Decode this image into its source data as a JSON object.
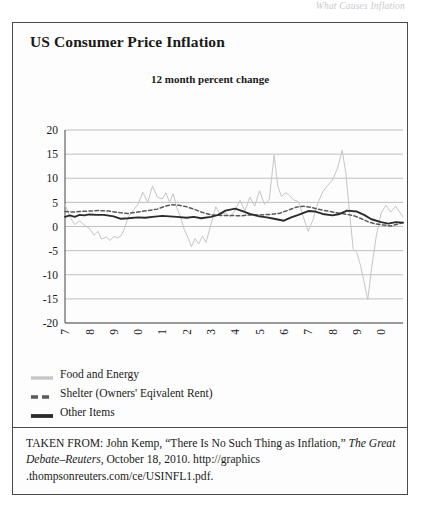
{
  "page": {
    "running_header": "What Causes Inflation"
  },
  "figure": {
    "title": "US Consumer Price Inflation",
    "subtitle": "12 month percent change"
  },
  "legend": {
    "items": [
      {
        "label": "Food and Energy",
        "color": "#c6c6c6",
        "style": "solid"
      },
      {
        "label": "Shelter (Owners' Eqivalent Rent)",
        "color": "#5a5a5a",
        "style": "dashed"
      },
      {
        "label": "Other Items",
        "color": "#2b2b2b",
        "style": "solid"
      }
    ]
  },
  "caption": {
    "lead": "TAKEN FROM: John Kemp, “There Is No Such Thing as Inflation,” ",
    "source_title": "The Great Debate–Reuters",
    "rest": ", October 18, 2010. http://graphics .thompsonreuters.com/ce/USINFL1.pdf."
  },
  "chart_data": {
    "type": "line",
    "title": "US Consumer Price Inflation",
    "subtitle": "12 month percent change",
    "xlabel": "",
    "ylabel": "",
    "ylim": [
      -20,
      20
    ],
    "yticks": [
      20,
      15,
      10,
      5,
      0,
      -5,
      -10,
      -15,
      -20
    ],
    "grid": true,
    "legend_position": "below",
    "xlim": [
      1997,
      2010.9
    ],
    "categories": [
      "1997",
      "1998",
      "1999",
      "2000",
      "2001",
      "2002",
      "2003",
      "2004",
      "2005",
      "2006",
      "2007",
      "2008",
      "2009",
      "2010"
    ],
    "series": [
      {
        "name": "Food and Energy",
        "color": "#c6c6c6",
        "style": "solid",
        "x": [
          1997.0,
          1997.2,
          1997.4,
          1997.6,
          1997.8,
          1998.0,
          1998.2,
          1998.35,
          1998.5,
          1998.7,
          1998.85,
          1999.0,
          1999.15,
          1999.3,
          1999.45,
          1999.6,
          1999.8,
          2000.0,
          2000.2,
          2000.4,
          2000.6,
          2000.8,
          2001.0,
          2001.15,
          2001.3,
          2001.45,
          2001.6,
          2001.75,
          2001.9,
          2002.05,
          2002.2,
          2002.35,
          2002.5,
          2002.65,
          2002.8,
          2003.0,
          2003.2,
          2003.4,
          2003.6,
          2003.8,
          2004.0,
          2004.2,
          2004.4,
          2004.6,
          2004.8,
          2005.0,
          2005.2,
          2005.4,
          2005.6,
          2005.75,
          2005.9,
          2006.05,
          2006.2,
          2006.4,
          2006.6,
          2006.8,
          2007.0,
          2007.2,
          2007.4,
          2007.6,
          2007.8,
          2008.0,
          2008.2,
          2008.4,
          2008.55,
          2008.7,
          2008.85,
          2009.0,
          2009.15,
          2009.3,
          2009.45,
          2009.6,
          2009.8,
          2010.0,
          2010.2,
          2010.4,
          2010.6,
          2010.9
        ],
        "y": [
          4.6,
          2.0,
          0.4,
          1.2,
          0.3,
          -0.4,
          -1.8,
          -1.0,
          -2.6,
          -2.2,
          -2.9,
          -2.1,
          -2.3,
          -2.0,
          -0.4,
          2.0,
          3.3,
          4.6,
          7.1,
          5.0,
          8.4,
          6.1,
          5.7,
          7.0,
          5.0,
          6.8,
          3.8,
          2.0,
          -0.6,
          -2.2,
          -4.2,
          -2.5,
          -3.6,
          -2.0,
          -3.3,
          0.4,
          4.1,
          2.4,
          2.8,
          2.0,
          3.4,
          5.4,
          3.2,
          6.1,
          4.2,
          7.4,
          4.6,
          5.6,
          14.8,
          8.4,
          6.2,
          7.0,
          6.6,
          5.5,
          5.2,
          2.0,
          -1.0,
          1.4,
          4.9,
          7.2,
          8.5,
          9.6,
          12.0,
          15.8,
          11.0,
          3.0,
          -4.6,
          -5.4,
          -8.0,
          -11.5,
          -15.2,
          -9.0,
          -2.0,
          2.8,
          4.4,
          3.0,
          4.2,
          2.0
        ]
      },
      {
        "name": "Shelter (Owners' Eqivalent Rent)",
        "color": "#5a5a5a",
        "style": "dashed",
        "x": [
          1997.0,
          1997.3,
          1997.6,
          1998.0,
          1998.4,
          1998.8,
          1999.2,
          1999.6,
          2000.0,
          2000.4,
          2000.8,
          2001.1,
          2001.4,
          2001.7,
          2002.0,
          2002.3,
          2002.6,
          2003.0,
          2003.4,
          2003.8,
          2004.2,
          2004.6,
          2005.0,
          2005.4,
          2005.8,
          2006.2,
          2006.5,
          2006.8,
          2007.1,
          2007.4,
          2007.8,
          2008.1,
          2008.5,
          2008.9,
          2009.2,
          2009.5,
          2009.8,
          2010.1,
          2010.4,
          2010.9
        ],
        "y": [
          3.1,
          3.0,
          3.1,
          3.2,
          3.3,
          3.2,
          2.9,
          2.7,
          3.0,
          3.3,
          3.6,
          4.2,
          4.5,
          4.4,
          4.1,
          3.6,
          3.0,
          2.4,
          2.3,
          2.3,
          2.2,
          2.4,
          2.4,
          2.5,
          2.7,
          3.4,
          4.0,
          4.2,
          4.0,
          3.6,
          3.2,
          2.9,
          2.6,
          2.2,
          1.6,
          0.9,
          0.5,
          0.3,
          0.1,
          0.8
        ]
      },
      {
        "name": "Other Items",
        "color": "#2b2b2b",
        "style": "solid",
        "x": [
          1997.0,
          1997.2,
          1997.4,
          1997.6,
          1997.8,
          1998.0,
          1998.3,
          1998.6,
          1999.0,
          1999.3,
          1999.6,
          2000.0,
          2000.3,
          2000.6,
          2001.0,
          2001.3,
          2001.6,
          2002.0,
          2002.3,
          2002.6,
          2003.0,
          2003.3,
          2003.6,
          2004.0,
          2004.3,
          2004.6,
          2005.0,
          2005.3,
          2005.6,
          2006.0,
          2006.3,
          2006.6,
          2007.0,
          2007.3,
          2007.6,
          2008.0,
          2008.3,
          2008.6,
          2009.0,
          2009.3,
          2009.6,
          2010.0,
          2010.3,
          2010.6,
          2010.9
        ],
        "y": [
          2.0,
          2.3,
          2.0,
          2.4,
          2.3,
          2.5,
          2.4,
          2.4,
          2.1,
          1.6,
          1.7,
          1.9,
          1.8,
          2.0,
          2.2,
          2.1,
          2.0,
          1.8,
          2.0,
          1.7,
          2.0,
          2.4,
          3.3,
          3.7,
          3.2,
          2.6,
          2.1,
          1.9,
          1.6,
          1.2,
          1.9,
          2.4,
          3.2,
          3.1,
          2.6,
          2.3,
          2.6,
          3.3,
          3.1,
          2.4,
          1.5,
          0.9,
          0.6,
          0.9,
          0.8
        ]
      }
    ]
  }
}
